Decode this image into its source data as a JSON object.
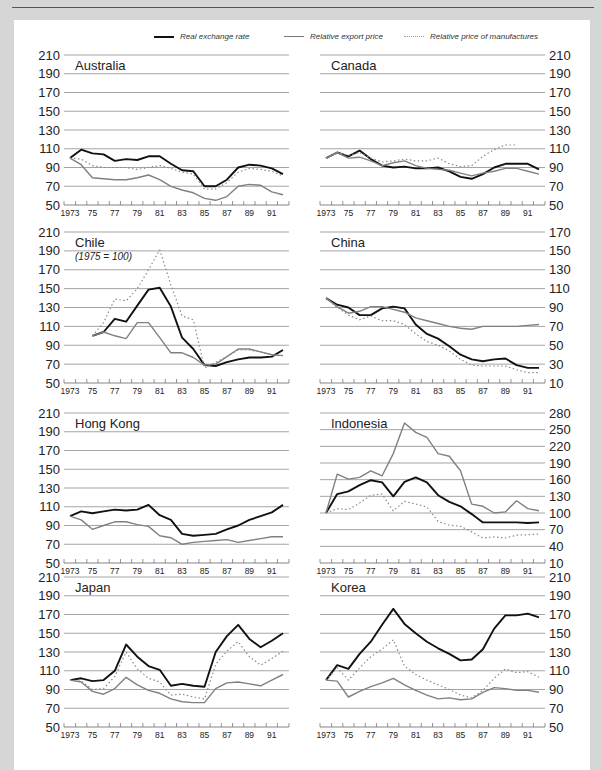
{
  "legend": {
    "real_exchange_rate": "Real exchange rate",
    "relative_export_price": "Relative export price",
    "relative_price_of_manufactures": "Relative price of manufactures"
  },
  "chart_data": [
    {
      "type": "line",
      "title": "Australia",
      "subtitle": "",
      "x": [
        1973,
        1974,
        1975,
        1976,
        1977,
        1978,
        1979,
        1980,
        1981,
        1982,
        1983,
        1984,
        1985,
        1986,
        1987,
        1988,
        1989,
        1990,
        1991,
        1992
      ],
      "ylim": [
        50,
        210
      ],
      "yticks": [
        210,
        190,
        170,
        150,
        130,
        110,
        90,
        70,
        50
      ],
      "axis_side": "left",
      "series": [
        {
          "name": "Real exchange rate",
          "values": [
            100,
            109,
            105,
            104,
            97,
            99,
            98,
            102,
            102,
            94,
            87,
            86,
            70,
            70,
            77,
            90,
            93,
            92,
            89,
            83
          ]
        },
        {
          "name": "Relative export price",
          "values": [
            100,
            93,
            79,
            78,
            77,
            77,
            79,
            82,
            77,
            70,
            66,
            63,
            57,
            55,
            59,
            70,
            72,
            71,
            64,
            61
          ]
        },
        {
          "name": "Relative price of manufactures",
          "values": [
            100,
            99,
            92,
            90,
            90,
            90,
            88,
            90,
            92,
            89,
            85,
            83,
            67,
            67,
            74,
            85,
            89,
            88,
            86,
            81
          ]
        }
      ]
    },
    {
      "type": "line",
      "title": "Canada",
      "subtitle": "",
      "x": [
        1973,
        1974,
        1975,
        1976,
        1977,
        1978,
        1979,
        1980,
        1981,
        1982,
        1983,
        1984,
        1985,
        1986,
        1987,
        1988,
        1989,
        1990,
        1991,
        1992
      ],
      "ylim": [
        50,
        210
      ],
      "yticks": [
        210,
        190,
        170,
        150,
        130,
        110,
        90,
        70,
        50
      ],
      "axis_side": "right",
      "series": [
        {
          "name": "Real exchange rate",
          "values": [
            100,
            106,
            102,
            108,
            99,
            92,
            90,
            91,
            89,
            89,
            90,
            86,
            80,
            78,
            83,
            90,
            94,
            94,
            94,
            88
          ]
        },
        {
          "name": "Relative export price",
          "values": [
            100,
            106,
            100,
            101,
            97,
            92,
            95,
            97,
            92,
            89,
            88,
            87,
            84,
            81,
            84,
            86,
            89,
            89,
            86,
            83
          ]
        },
        {
          "name": "Relative price of manufactures",
          "values": [
            100,
            106,
            103,
            106,
            100,
            96,
            97,
            99,
            97,
            97,
            100,
            94,
            91,
            92,
            102,
            109,
            114,
            114
          ]
        }
      ]
    },
    {
      "type": "line",
      "title": "Chile",
      "subtitle": "(1975 = 100)",
      "x": [
        1975,
        1976,
        1977,
        1978,
        1979,
        1980,
        1981,
        1982,
        1983,
        1984,
        1985,
        1986,
        1987,
        1988,
        1989,
        1990,
        1991,
        1992
      ],
      "ylim": [
        50,
        210
      ],
      "yticks": [
        210,
        190,
        170,
        150,
        130,
        110,
        90,
        70,
        50
      ],
      "axis_side": "left",
      "series": [
        {
          "name": "Real exchange rate",
          "values": [
            100,
            104,
            118,
            115,
            132,
            149,
            151,
            131,
            98,
            86,
            69,
            68,
            72,
            75,
            77,
            77,
            78,
            85
          ]
        },
        {
          "name": "Relative export price",
          "values": [
            100,
            104,
            100,
            97,
            114,
            114,
            98,
            82,
            82,
            77,
            69,
            70,
            78,
            86,
            86,
            83,
            80,
            79
          ]
        },
        {
          "name": "Relative price of manufactures",
          "values": [
            100,
            114,
            139,
            137,
            150,
            170,
            191,
            154,
            121,
            117,
            66,
            72,
            78,
            85,
            85,
            83,
            80,
            79
          ]
        }
      ]
    },
    {
      "type": "line",
      "title": "China",
      "subtitle": "",
      "x": [
        1973,
        1974,
        1975,
        1976,
        1977,
        1978,
        1979,
        1980,
        1981,
        1982,
        1983,
        1984,
        1985,
        1986,
        1987,
        1988,
        1989,
        1990,
        1991,
        1992
      ],
      "ylim": [
        10,
        170
      ],
      "yticks": [
        170,
        150,
        130,
        110,
        90,
        70,
        50,
        30,
        10
      ],
      "axis_side": "right",
      "series": [
        {
          "name": "Real exchange rate",
          "values": [
            100,
            93,
            90,
            82,
            82,
            89,
            91,
            89,
            72,
            62,
            57,
            49,
            40,
            35,
            33,
            35,
            36,
            29,
            26,
            26
          ]
        },
        {
          "name": "Relative export price",
          "values": [
            100,
            91,
            84,
            86,
            91,
            91,
            88,
            85,
            79,
            76,
            73,
            70,
            68,
            67,
            70,
            70,
            70,
            70,
            71,
            72
          ]
        },
        {
          "name": "Relative price of manufactures",
          "values": [
            100,
            90,
            82,
            77,
            81,
            76,
            76,
            72,
            62,
            54,
            50,
            44,
            35,
            29,
            28,
            28,
            28,
            24,
            21,
            21
          ]
        }
      ]
    },
    {
      "type": "line",
      "title": "Hong Kong",
      "subtitle": "",
      "x": [
        1973,
        1974,
        1975,
        1976,
        1977,
        1978,
        1979,
        1980,
        1981,
        1982,
        1983,
        1984,
        1985,
        1986,
        1987,
        1988,
        1989,
        1990,
        1991,
        1992
      ],
      "ylim": [
        50,
        210
      ],
      "yticks": [
        210,
        190,
        170,
        150,
        130,
        110,
        90,
        70,
        50
      ],
      "axis_side": "left",
      "series": [
        {
          "name": "Real exchange rate",
          "values": [
            100,
            105,
            103,
            105,
            107,
            106,
            107,
            112,
            101,
            96,
            81,
            79,
            80,
            81,
            86,
            90,
            96,
            100,
            104,
            112
          ]
        },
        {
          "name": "Relative export price",
          "values": [
            100,
            96,
            86,
            90,
            94,
            94,
            91,
            89,
            79,
            77,
            70,
            72,
            73,
            74,
            75,
            72,
            74,
            76,
            78,
            78
          ]
        }
      ]
    },
    {
      "type": "line",
      "title": "Indonesia",
      "subtitle": "",
      "x": [
        1973,
        1974,
        1975,
        1976,
        1977,
        1978,
        1979,
        1980,
        1981,
        1982,
        1983,
        1984,
        1985,
        1986,
        1987,
        1988,
        1989,
        1990,
        1991,
        1992
      ],
      "ylim": [
        10,
        280
      ],
      "yticks": [
        280,
        250,
        220,
        190,
        160,
        130,
        100,
        70,
        40,
        10
      ],
      "axis_side": "right",
      "series": [
        {
          "name": "Real exchange rate",
          "values": [
            100,
            134,
            139,
            150,
            159,
            155,
            130,
            156,
            164,
            155,
            132,
            120,
            112,
            98,
            83,
            83,
            83,
            83,
            82,
            83
          ]
        },
        {
          "name": "Relative export price",
          "values": [
            100,
            170,
            161,
            164,
            176,
            167,
            207,
            262,
            245,
            236,
            207,
            202,
            176,
            116,
            112,
            100,
            102,
            122,
            108,
            104
          ]
        },
        {
          "name": "Relative price of manufactures",
          "values": [
            100,
            108,
            106,
            118,
            132,
            134,
            104,
            121,
            116,
            111,
            85,
            78,
            76,
            66,
            55,
            57,
            55,
            60,
            61,
            62
          ]
        }
      ]
    },
    {
      "type": "line",
      "title": "Japan",
      "subtitle": "",
      "x": [
        1973,
        1974,
        1975,
        1976,
        1977,
        1978,
        1979,
        1980,
        1981,
        1982,
        1983,
        1984,
        1985,
        1986,
        1987,
        1988,
        1989,
        1990,
        1991,
        1992
      ],
      "ylim": [
        50,
        210
      ],
      "yticks": [
        210,
        190,
        170,
        150,
        130,
        110,
        90,
        70,
        50
      ],
      "axis_side": "left",
      "series": [
        {
          "name": "Real exchange rate",
          "values": [
            100,
            102,
            99,
            100,
            110,
            138,
            125,
            115,
            111,
            94,
            96,
            94,
            93,
            130,
            147,
            159,
            144,
            135,
            142,
            150
          ]
        },
        {
          "name": "Relative export price",
          "values": [
            100,
            98,
            88,
            85,
            91,
            103,
            95,
            89,
            86,
            80,
            77,
            76,
            76,
            91,
            97,
            98,
            96,
            94,
            100,
            106
          ]
        },
        {
          "name": "Relative price of manufactures",
          "values": [
            100,
            99,
            90,
            91,
            104,
            130,
            112,
            102,
            98,
            84,
            85,
            82,
            80,
            117,
            131,
            141,
            125,
            116,
            123,
            131
          ]
        }
      ]
    },
    {
      "type": "line",
      "title": "Korea",
      "subtitle": "",
      "x": [
        1973,
        1974,
        1975,
        1976,
        1977,
        1978,
        1979,
        1980,
        1981,
        1982,
        1983,
        1984,
        1985,
        1986,
        1987,
        1988,
        1989,
        1990,
        1991,
        1992
      ],
      "ylim": [
        50,
        210
      ],
      "yticks": [
        210,
        190,
        170,
        150,
        130,
        110,
        90,
        70,
        50
      ],
      "axis_side": "right",
      "series": [
        {
          "name": "Real exchange rate",
          "values": [
            100,
            116,
            112,
            128,
            141,
            159,
            176,
            160,
            150,
            141,
            134,
            128,
            121,
            122,
            133,
            155,
            169,
            169,
            171,
            167
          ]
        },
        {
          "name": "Relative export price",
          "values": [
            100,
            99,
            82,
            88,
            93,
            97,
            102,
            95,
            89,
            84,
            80,
            81,
            79,
            80,
            87,
            92,
            91,
            89,
            89,
            87
          ]
        },
        {
          "name": "Relative price of manufactures",
          "values": [
            100,
            113,
            100,
            113,
            125,
            133,
            143,
            115,
            106,
            100,
            95,
            90,
            84,
            81,
            89,
            102,
            112,
            108,
            109,
            103
          ]
        }
      ]
    }
  ],
  "x_tick_labels": [
    "1973",
    "75",
    "77",
    "79",
    "81",
    "83",
    "85",
    "87",
    "89",
    "91"
  ]
}
